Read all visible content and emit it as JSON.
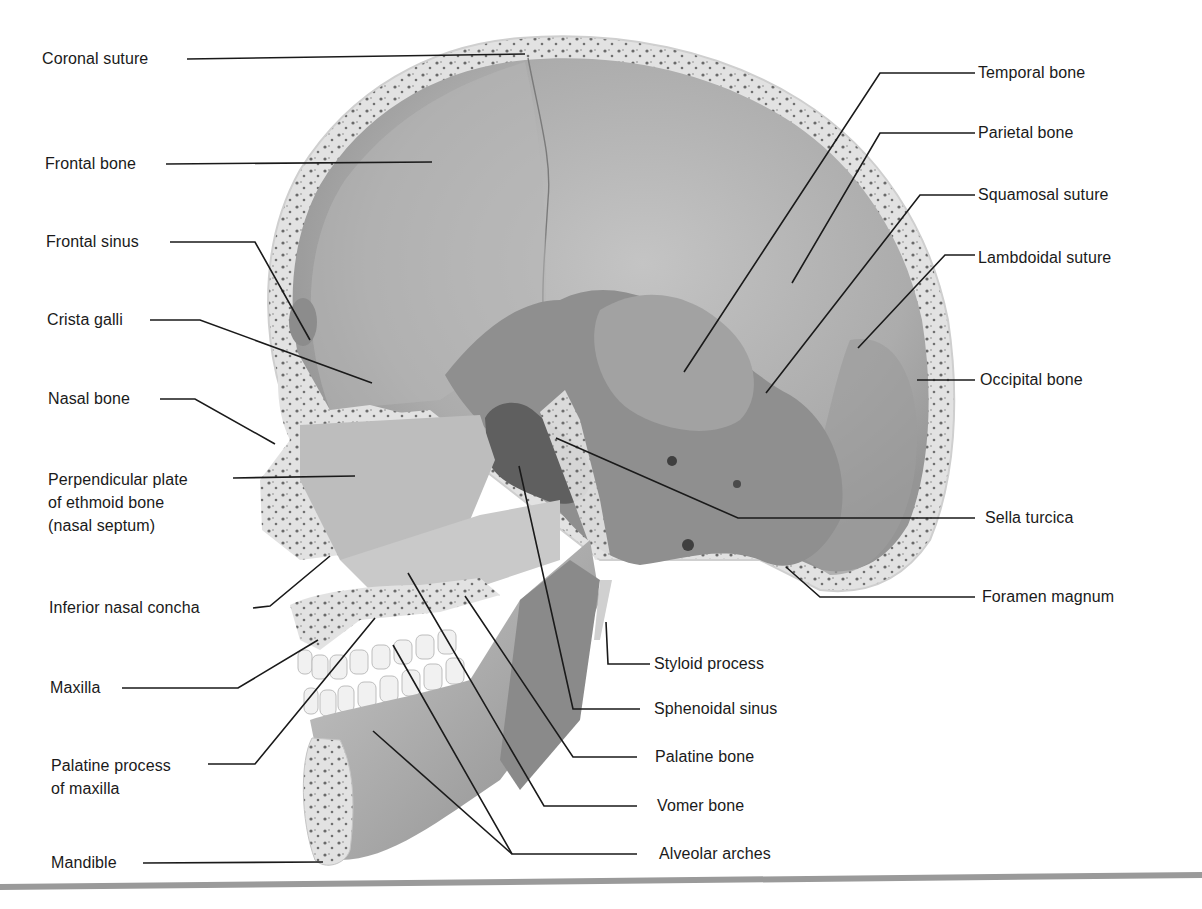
{
  "figure": {
    "left_labels": [
      {
        "id": "coronal-suture",
        "text": "Coronal suture"
      },
      {
        "id": "frontal-bone",
        "text": "Frontal bone"
      },
      {
        "id": "frontal-sinus",
        "text": "Frontal sinus"
      },
      {
        "id": "crista-galli",
        "text": "Crista galli"
      },
      {
        "id": "nasal-bone",
        "text": "Nasal bone"
      },
      {
        "id": "perpendicular-plate",
        "text": "Perpendicular plate\nof ethmoid bone\n(nasal septum)"
      },
      {
        "id": "inferior-nasal-concha",
        "text": "Inferior nasal concha"
      },
      {
        "id": "maxilla",
        "text": "Maxilla"
      },
      {
        "id": "palatine-process",
        "text": "Palatine process\nof maxilla"
      },
      {
        "id": "mandible",
        "text": "Mandible"
      }
    ],
    "right_labels": [
      {
        "id": "temporal-bone",
        "text": "Temporal bone"
      },
      {
        "id": "parietal-bone",
        "text": "Parietal bone"
      },
      {
        "id": "squamosal-suture",
        "text": "Squamosal suture"
      },
      {
        "id": "lambdoidal-suture",
        "text": "Lambdoidal suture"
      },
      {
        "id": "occipital-bone",
        "text": "Occipital bone"
      },
      {
        "id": "sella-turcica",
        "text": "Sella turcica"
      },
      {
        "id": "foramen-magnum",
        "text": "Foramen magnum"
      }
    ],
    "bottom_labels": [
      {
        "id": "styloid-process",
        "text": "Styloid process"
      },
      {
        "id": "sphenoidal-sinus",
        "text": "Sphenoidal sinus"
      },
      {
        "id": "palatine-bone",
        "text": "Palatine bone"
      },
      {
        "id": "vomer-bone",
        "text": "Vomer bone"
      },
      {
        "id": "alveolar-arches",
        "text": "Alveolar arches"
      }
    ]
  },
  "colors": {
    "bone_surface": "#a8a8a8",
    "bone_dark": "#8a8a8a",
    "cortex": "#e4e4e4",
    "marrow_dots": "#6a6a6a",
    "leader_line": "#1a1a1a",
    "bottom_rule": "#9a9a9a"
  }
}
